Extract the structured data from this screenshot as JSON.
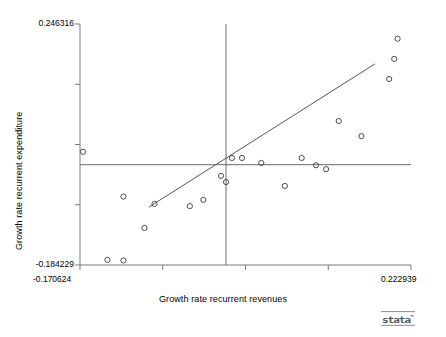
{
  "chart_data": {
    "type": "scatter",
    "title": "",
    "xlabel": "Growth rate recurrent revenues",
    "ylabel": "Growth rate recurrent expenditure",
    "xlim": [
      -0.170624,
      0.222939
    ],
    "ylim": [
      -0.184229,
      0.246316
    ],
    "xticklabels": [
      "-0.170624",
      "0.222939"
    ],
    "yticklabels": [
      "0.246316",
      "-0.184229"
    ],
    "xtick_count": 5,
    "ytick_count": 5,
    "grid": false,
    "legend": null,
    "marker": "open-circle",
    "marker_color": "#3a3a3a",
    "line_color": "#555555",
    "points": [
      {
        "x": -0.167,
        "y": 0.018
      },
      {
        "x": -0.119,
        "y": -0.062
      },
      {
        "x": -0.138,
        "y": -0.175
      },
      {
        "x": -0.119,
        "y": -0.176
      },
      {
        "x": -0.094,
        "y": -0.118
      },
      {
        "x": -0.082,
        "y": -0.075
      },
      {
        "x": -0.04,
        "y": -0.079
      },
      {
        "x": -0.024,
        "y": -0.068
      },
      {
        "x": -0.003,
        "y": -0.025
      },
      {
        "x": 0.003,
        "y": -0.036
      },
      {
        "x": 0.01,
        "y": 0.007
      },
      {
        "x": 0.022,
        "y": 0.007
      },
      {
        "x": 0.045,
        "y": -0.002
      },
      {
        "x": 0.073,
        "y": -0.043
      },
      {
        "x": 0.093,
        "y": 0.007
      },
      {
        "x": 0.11,
        "y": -0.006
      },
      {
        "x": 0.122,
        "y": -0.013
      },
      {
        "x": 0.137,
        "y": 0.073
      },
      {
        "x": 0.164,
        "y": 0.046
      },
      {
        "x": 0.197,
        "y": 0.148
      },
      {
        "x": 0.203,
        "y": 0.184
      },
      {
        "x": 0.207,
        "y": 0.22
      }
    ],
    "fit_line": {
      "name": "linear-fit",
      "x_start": -0.089,
      "y_start": -0.081,
      "x_end": 0.18,
      "y_end": 0.175
    },
    "reference_lines": [
      {
        "name": "horizontal-mean-line",
        "orientation": "horizontal",
        "y": -0.005
      },
      {
        "name": "vertical-mean-line",
        "orientation": "vertical",
        "x": 0.003
      }
    ]
  },
  "branding": {
    "logo_text": "stata",
    "logo_mark": "™"
  }
}
